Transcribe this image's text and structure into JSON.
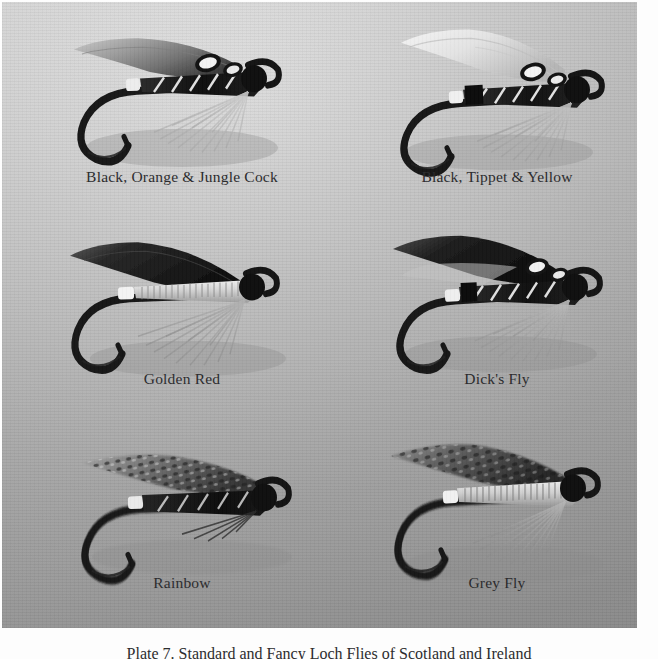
{
  "page": {
    "background_color": "#ffffff",
    "plate_background_colors": [
      "#f3f3f3",
      "#d9d9d9",
      "#bdbdbd"
    ],
    "bottom_caption": "Plate 7.  Standard and Fancy Loch Flies of Scotland and Ireland"
  },
  "plate": {
    "columns": 2,
    "rows": 3,
    "flies": [
      {
        "id": "black-orange-jungle-cock",
        "caption": "Black, Orange & Jungle Cock",
        "row": 1,
        "col": 1,
        "wing_tone": "#9a9a9a",
        "body_tone": "#141414",
        "hackle_tone": "#d7d7d7",
        "has_jungle_cock_eyes": true,
        "rib_style": "silver-tinsel-diagonal",
        "tag_color": "#e4e4e4"
      },
      {
        "id": "black-tippet-yellow",
        "caption": "Black, Tippet & Yellow",
        "row": 1,
        "col": 2,
        "wing_tone": "#e2e2e2",
        "body_tone": "#1a1a1a",
        "hackle_tone": "#c8c8c8",
        "has_jungle_cock_eyes": true,
        "rib_style": "silver-tinsel-diagonal",
        "tag_color": "#efefef"
      },
      {
        "id": "golden-red",
        "caption": "Golden Red",
        "row": 2,
        "col": 1,
        "wing_tone": "#232323",
        "body_tone": "#cfcfcf",
        "hackle_tone": "#b4b4b4",
        "has_jungle_cock_eyes": false,
        "rib_style": "fine-silver-wire-wrap",
        "tag_color": "#f2f2f2"
      },
      {
        "id": "dicks-fly",
        "caption": "Dick's Fly",
        "row": 2,
        "col": 2,
        "wing_tone": "#1e1e1e",
        "body_tone": "#151515",
        "hackle_tone": "#c0c0c0",
        "has_jungle_cock_eyes": true,
        "rib_style": "silver-tinsel-diagonal",
        "tag_color": "#ededed"
      },
      {
        "id": "rainbow",
        "caption": "Rainbow",
        "row": 3,
        "col": 1,
        "wing_tone": "#6f6f6f",
        "body_tone": "#121212",
        "hackle_tone": "#2a2a2a",
        "has_jungle_cock_eyes": false,
        "rib_style": "silver-tinsel-diagonal",
        "tag_color": "#e8e8e8"
      },
      {
        "id": "grey-fly",
        "caption": "Grey Fly",
        "row": 3,
        "col": 2,
        "wing_tone": "#555555",
        "body_tone": "#c6c6c6",
        "hackle_tone": "#a9a9a9",
        "has_jungle_cock_eyes": false,
        "rib_style": "fine-silver-wire-wrap",
        "tag_color": "#efefef"
      }
    ]
  }
}
